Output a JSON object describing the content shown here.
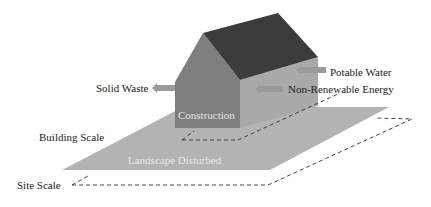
{
  "diagram": {
    "title": "",
    "labels": {
      "solid_waste": "Solid Waste",
      "potable_water": "Potable Water",
      "non_renewable_energy": "Non-Renewable Energy",
      "construction": "Construction",
      "building_scale": "Building Scale",
      "landscape_disturbed": "Landscape Disturbed",
      "site_scale": "Site Scale"
    },
    "flows": [
      {
        "name": "Solid Waste",
        "direction": "out"
      },
      {
        "name": "Potable Water",
        "direction": "in"
      },
      {
        "name": "Non-Renewable Energy",
        "direction": "in"
      }
    ],
    "colors": {
      "roof": "#3c3c3c",
      "gable": "#7e7e7e",
      "side_wall": "#a9a9a9",
      "landscape": "#b3b3b3",
      "arrow": "#9a9a9a",
      "dashed_outline": "#333333"
    }
  }
}
